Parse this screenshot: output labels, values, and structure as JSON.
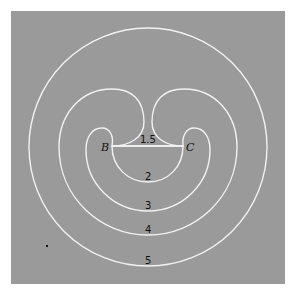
{
  "figure": {
    "background_color": "#9a9a9a",
    "line_color": "#f4f4f4",
    "page_color": "#ffffff"
  },
  "points": {
    "B": "B",
    "C": "C"
  },
  "curve_labels": {
    "c15": "1.5",
    "c2": "2",
    "c3": "3",
    "c4": "4",
    "c5": "5"
  }
}
